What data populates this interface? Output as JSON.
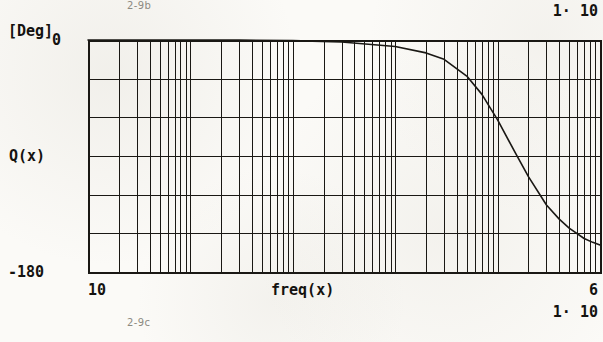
{
  "figure": {
    "caption_top": "2-9b",
    "caption_bottom": "2-9c"
  },
  "top_right_scale": {
    "mantissa": "1· 10",
    "exponent": ""
  },
  "axes": {
    "y": {
      "unit_label": "[Deg]",
      "variable_label": "Q(x)",
      "max_label": "0",
      "min_label": "-180"
    },
    "x": {
      "variable_label": "freq(x)",
      "min_label": "10",
      "max_mantissa": "1· 10",
      "max_exponent": "6"
    }
  },
  "colors": {
    "ink": "#14120f",
    "grid": "#1a1814",
    "paper": "#fbfaf7",
    "faint_text": "#8d8a82"
  },
  "chart_data": {
    "type": "line",
    "title": "",
    "xlabel": "freq(x)",
    "ylabel": "Q(x)",
    "y_unit": "[Deg]",
    "xscale": "log",
    "yscale": "linear",
    "xlim": [
      10,
      1000000
    ],
    "ylim": [
      -180,
      0
    ],
    "ytick_step": 30,
    "yticks": [
      0,
      -30,
      -60,
      -90,
      -120,
      -150,
      -180
    ],
    "ytick_labels": [
      "0",
      "",
      "",
      "",
      "",
      "",
      "-180"
    ],
    "xticks": [
      10,
      100,
      1000,
      10000,
      100000,
      1000000
    ],
    "xtick_labels": [
      "10",
      "",
      "",
      "",
      "",
      "1· 10^6"
    ],
    "grid": true,
    "grid_minor": true,
    "legend": false,
    "plot_box": {
      "left": 88,
      "top": 40,
      "right": 600,
      "bottom": 272
    },
    "series": [
      {
        "name": "Q(x)",
        "x": [
          10,
          30,
          100,
          300,
          1000,
          3000,
          10000,
          20000,
          30000,
          50000,
          70000,
          100000,
          150000,
          200000,
          300000,
          400000,
          500000,
          700000,
          850000,
          1000000
        ],
        "y": [
          0,
          0,
          0,
          0,
          -0.5,
          -1.5,
          -5,
          -10,
          -15,
          -28,
          -42,
          -62,
          -88,
          -106,
          -128,
          -139,
          -146,
          -154,
          -157,
          -159
        ]
      }
    ]
  }
}
